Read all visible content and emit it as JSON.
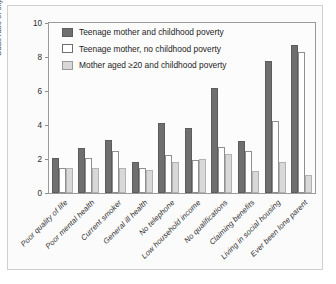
{
  "chart_data": {
    "type": "bar",
    "title": "",
    "subtitle": "",
    "xlabel": "",
    "ylabel": "Odds ratio of experiencing",
    "ylim": [
      0,
      10
    ],
    "yticks": [
      0,
      2,
      4,
      6,
      8,
      10
    ],
    "grid": false,
    "legend_position": "top-left",
    "categories": [
      "Poor quality of life",
      "Poor mental health",
      "Current smoker",
      "General ill health",
      "No telephone",
      "Low household income",
      "No qualifications",
      "Claiming benefits",
      "Living in social housing",
      "Ever been lone parent"
    ],
    "series": [
      {
        "name": "Teenage mother and childhood poverty",
        "color": "#6f6f6f",
        "values": [
          2.05,
          2.65,
          3.1,
          1.85,
          4.1,
          3.8,
          6.2,
          3.05,
          7.75,
          8.7
        ]
      },
      {
        "name": "Teenage mother, no childhood poverty",
        "color": "#ffffff",
        "values": [
          1.5,
          2.05,
          2.45,
          1.5,
          2.25,
          1.95,
          2.7,
          2.45,
          4.25,
          8.3
        ]
      },
      {
        "name": "Mother aged ≥20 and childhood poverty",
        "color": "#d8d8d8",
        "values": [
          1.45,
          1.5,
          1.45,
          1.35,
          1.85,
          2.0,
          2.3,
          1.3,
          1.85,
          1.05
        ]
      }
    ]
  },
  "legend": {
    "items": [
      "Teenage mother and childhood poverty",
      "Teenage mother, no childhood poverty",
      "Mother aged ≥20 and childhood poverty"
    ]
  }
}
